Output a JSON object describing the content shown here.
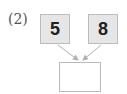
{
  "problem": {
    "label": "(2)",
    "numbers": [
      {
        "value": "5"
      },
      {
        "value": "8"
      }
    ],
    "answer": ""
  },
  "colors": {
    "box_fill": "#e6e6e6",
    "box_border": "#bbbbbb",
    "arrow": "#b0b0b0",
    "text": "#222222"
  }
}
